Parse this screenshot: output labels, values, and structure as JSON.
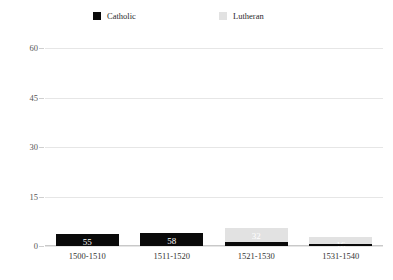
{
  "chart_data": {
    "type": "bar",
    "subtype": "stacked-bar",
    "title": "",
    "xlabel": "",
    "ylabel": "",
    "categories": [
      "1500-1510",
      "1511-1520",
      "1521-1530",
      "1531-1540"
    ],
    "series": [
      {
        "name": "Catholic",
        "color": "#0a0a0a",
        "values": [
          55,
          58,
          9,
          4
        ]
      },
      {
        "name": "Lutheran",
        "color": "#e2e2e2",
        "values": [
          0,
          0,
          32,
          16
        ]
      }
    ],
    "ylim": [
      0,
      60
    ],
    "yticks": [
      0,
      15,
      30,
      45,
      60
    ],
    "ytick_labels": [
      "0",
      "15",
      "30",
      "45",
      "60"
    ],
    "grid": true,
    "legend_position": "top",
    "data_labels": {
      "1500-1510": {
        "Catholic": "55",
        "Lutheran": ""
      },
      "1511-1520": {
        "Catholic": "58",
        "Lutheran": ""
      },
      "1521-1530": {
        "Catholic": "9",
        "Lutheran": "32"
      },
      "1531-1540": {
        "Catholic": "4",
        "Lutheran": "16"
      }
    }
  },
  "legend": {
    "items": [
      {
        "label": "Catholic",
        "color": "#0a0a0a",
        "swatch_icon": "square-filled-icon"
      },
      {
        "label": "Lutheran",
        "color": "#e2e2e2",
        "swatch_icon": "square-filled-icon"
      }
    ]
  }
}
